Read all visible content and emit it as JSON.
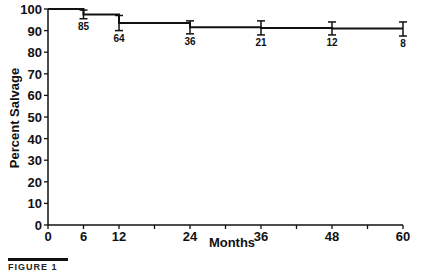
{
  "chart_data": {
    "type": "line",
    "subtype": "step-kaplan-meier",
    "title": "",
    "xlabel": "Months",
    "ylabel": "Percent Salvage",
    "xlim": [
      0,
      60
    ],
    "ylim": [
      0,
      100
    ],
    "x_ticks": [
      0,
      6,
      12,
      18,
      24,
      30,
      36,
      42,
      48,
      54,
      60
    ],
    "x_tick_labels": [
      "0",
      "6",
      "12",
      "",
      "24",
      "",
      "36",
      "",
      "48",
      "",
      "60"
    ],
    "y_ticks": [
      0,
      10,
      20,
      30,
      40,
      50,
      60,
      70,
      80,
      90,
      100
    ],
    "y_tick_labels": [
      "0",
      "10",
      "20",
      "30",
      "40",
      "50",
      "60",
      "70",
      "80",
      "90",
      "100"
    ],
    "grid": false,
    "legend": null,
    "series": [
      {
        "name": "Percent Salvage",
        "steps": [
          {
            "x_start": 0,
            "x_end": 6,
            "y": 100
          },
          {
            "x_start": 6,
            "x_end": 12,
            "y": 97.5
          },
          {
            "x_start": 12,
            "x_end": 24,
            "y": 93.5
          },
          {
            "x_start": 24,
            "x_end": 36,
            "y": 91.5
          },
          {
            "x_start": 36,
            "x_end": 48,
            "y": 91.2
          },
          {
            "x_start": 48,
            "x_end": 60,
            "y": 91.0
          }
        ],
        "points": [
          {
            "x": 6,
            "y": 97.5,
            "err_low": 95.5,
            "err_high": 99.5,
            "n_at_risk": "85"
          },
          {
            "x": 12,
            "y": 93.5,
            "err_low": 90.0,
            "err_high": 97.0,
            "n_at_risk": "64"
          },
          {
            "x": 24,
            "y": 91.5,
            "err_low": 88.5,
            "err_high": 94.5,
            "n_at_risk": "36"
          },
          {
            "x": 36,
            "y": 91.2,
            "err_low": 88.0,
            "err_high": 94.5,
            "n_at_risk": "21"
          },
          {
            "x": 48,
            "y": 91.0,
            "err_low": 88.0,
            "err_high": 94.0,
            "n_at_risk": "12"
          },
          {
            "x": 60,
            "y": 90.5,
            "err_low": 87.5,
            "err_high": 94.0,
            "n_at_risk": "8"
          }
        ]
      }
    ]
  },
  "caption": {
    "text": "FIGURE 1"
  },
  "colors": {
    "line": "#111111",
    "background": "#ffffff"
  }
}
